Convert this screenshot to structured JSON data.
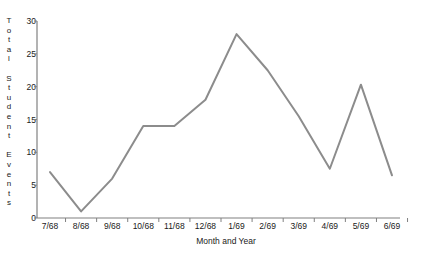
{
  "chart_data": {
    "type": "line",
    "title": "",
    "xlabel": "Month and Year",
    "ylabel": "Total Student Events",
    "categories": [
      "7/68",
      "8/68",
      "9/68",
      "10/68",
      "11/68",
      "12/68",
      "1/69",
      "2/69",
      "3/69",
      "4/69",
      "5/69",
      "6/69"
    ],
    "values": [
      7,
      1,
      6,
      14,
      14,
      18,
      28,
      22.5,
      15.5,
      7.5,
      20.3,
      6.5
    ],
    "series": [
      {
        "name": "Total Student Events",
        "values": [
          7,
          1,
          6,
          14,
          14,
          18,
          28,
          22.5,
          15.5,
          7.5,
          20.3,
          6.5
        ]
      }
    ],
    "ylim": [
      0,
      30
    ],
    "yticks": [
      0,
      5,
      10,
      15,
      20,
      25,
      30
    ],
    "ytick_labels": [
      "0",
      "5",
      "10",
      "15",
      "20",
      "25",
      "30"
    ],
    "grid": false,
    "legend": "none",
    "line_color": "#8c8c8c",
    "axis_color": "#808080",
    "text_color": "#1a1a1a",
    "background": "#ffffff"
  },
  "axes": {
    "y_title_chars": [
      "T",
      "o",
      "t",
      "a",
      "l",
      "",
      "S",
      "t",
      "u",
      "d",
      "e",
      "n",
      "t",
      "",
      "E",
      "v",
      "e",
      "n",
      "t",
      "s"
    ],
    "x_title": "Month and Year"
  }
}
